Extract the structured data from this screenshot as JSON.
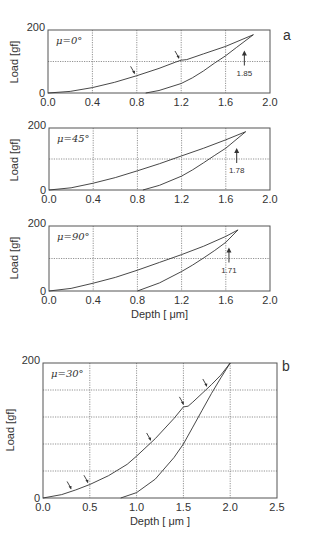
{
  "figure": {
    "panel_a_label": "a",
    "panel_b_label": "b",
    "x_label_a": "Depth [ μm]",
    "x_label_b": "Depth [ μm ]",
    "y_label": "Load [gf]"
  },
  "chart_data": [
    {
      "type": "line",
      "panel": "a",
      "annotation_angle": "μ=0°",
      "xlabel": "",
      "ylabel": "Load [gf]",
      "xlim": [
        0,
        2.0
      ],
      "ylim": [
        0,
        200
      ],
      "xticks": [
        "0.0",
        "0.4",
        "0.8",
        "1.2",
        "1.6",
        "2.0"
      ],
      "yticks": [
        "0",
        "200"
      ],
      "grid": true,
      "max_depth_label": "1.85",
      "series": [
        {
          "name": "loading",
          "x": [
            0.0,
            0.2,
            0.4,
            0.6,
            0.8,
            1.0,
            1.15,
            1.2,
            1.25,
            1.4,
            1.6,
            1.85
          ],
          "y": [
            0,
            5,
            17,
            34,
            55,
            78,
            98,
            104,
            106,
            124,
            148,
            185
          ]
        },
        {
          "name": "unloading",
          "x": [
            0.88,
            1.0,
            1.2,
            1.3,
            1.4,
            1.5,
            1.6,
            1.7,
            1.85
          ],
          "y": [
            0,
            8,
            30,
            48,
            70,
            95,
            118,
            145,
            185
          ]
        }
      ],
      "arrows_on_loading_at_depth": [
        0.78,
        1.18
      ]
    },
    {
      "type": "line",
      "panel": "a",
      "annotation_angle": "μ=45°",
      "xlabel": "",
      "ylabel": "Load [gf]",
      "xlim": [
        0,
        2.0
      ],
      "ylim": [
        0,
        200
      ],
      "xticks": [
        "0.0",
        "0.4",
        "0.8",
        "1.2",
        "1.6",
        "2.0"
      ],
      "yticks": [
        "0",
        "200"
      ],
      "grid": true,
      "max_depth_label": "1.78",
      "series": [
        {
          "name": "loading",
          "x": [
            0.0,
            0.2,
            0.4,
            0.6,
            0.8,
            1.0,
            1.2,
            1.4,
            1.6,
            1.78
          ],
          "y": [
            0,
            7,
            22,
            40,
            62,
            85,
            110,
            135,
            162,
            188
          ]
        },
        {
          "name": "unloading",
          "x": [
            0.85,
            1.0,
            1.2,
            1.3,
            1.4,
            1.5,
            1.6,
            1.78
          ],
          "y": [
            0,
            15,
            45,
            65,
            88,
            112,
            135,
            188
          ]
        }
      ]
    },
    {
      "type": "line",
      "panel": "a",
      "annotation_angle": "μ=90°",
      "xlabel": "Depth [ μm]",
      "ylabel": "Load [gf]",
      "xlim": [
        0,
        2.0
      ],
      "ylim": [
        0,
        200
      ],
      "xticks": [
        "0.0",
        "0.4",
        "0.8",
        "1.2",
        "1.6",
        "2.0"
      ],
      "yticks": [
        "0",
        "200"
      ],
      "grid": true,
      "max_depth_label": "1.71",
      "series": [
        {
          "name": "loading",
          "x": [
            0.0,
            0.2,
            0.4,
            0.6,
            0.8,
            1.0,
            1.2,
            1.4,
            1.6,
            1.71
          ],
          "y": [
            0,
            8,
            24,
            42,
            64,
            88,
            112,
            138,
            168,
            188
          ]
        },
        {
          "name": "unloading",
          "x": [
            0.8,
            1.0,
            1.2,
            1.3,
            1.4,
            1.5,
            1.6,
            1.71
          ],
          "y": [
            0,
            25,
            60,
            80,
            102,
            125,
            150,
            188
          ]
        }
      ]
    },
    {
      "type": "line",
      "panel": "b",
      "annotation_angle": "μ=30°",
      "xlabel": "Depth [ μm ]",
      "ylabel": "Load [gf]",
      "xlim": [
        0,
        2.5
      ],
      "ylim": [
        0,
        200
      ],
      "xticks": [
        "0.0",
        "0.5",
        "1.0",
        "1.5",
        "2.0",
        "2.5"
      ],
      "yticks": [
        "0",
        "200"
      ],
      "grid": true,
      "series": [
        {
          "name": "loading",
          "x": [
            0.0,
            0.2,
            0.35,
            0.5,
            0.7,
            0.9,
            1.0,
            1.2,
            1.4,
            1.5,
            1.55,
            1.6,
            1.7,
            1.8,
            1.9,
            2.0
          ],
          "y": [
            0,
            5,
            12,
            20,
            33,
            50,
            62,
            88,
            118,
            135,
            136,
            142,
            155,
            168,
            182,
            200
          ]
        },
        {
          "name": "unloading",
          "x": [
            0.83,
            1.0,
            1.2,
            1.4,
            1.5,
            1.6,
            1.7,
            1.8,
            1.9,
            2.0
          ],
          "y": [
            0,
            8,
            28,
            60,
            80,
            105,
            130,
            155,
            178,
            200
          ]
        }
      ],
      "arrows_on_loading_at_depth": [
        0.3,
        0.48,
        1.15,
        1.5,
        1.75
      ]
    }
  ]
}
